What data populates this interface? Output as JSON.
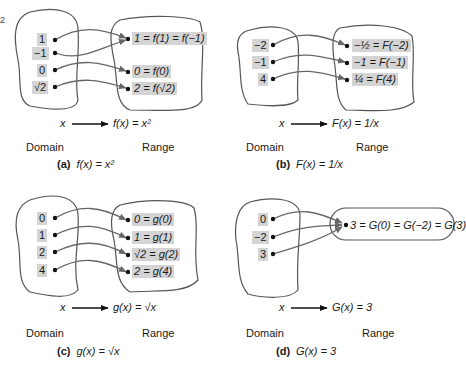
{
  "corner_mark": "2",
  "common": {
    "domain_label": "Domain",
    "range_label": "Range"
  },
  "panels": [
    {
      "id": "a",
      "caption_letter": "(a)",
      "caption_formula": "f(x) = x²",
      "mapping_x": "x",
      "mapping_fx": "f(x) = x²",
      "domain": [
        "1",
        "−1",
        "0",
        "√2"
      ],
      "range": [
        "1 = f(1) = f(−1)",
        "0 = f(0)",
        "2 = f(√2)"
      ],
      "arrows": [
        [
          0,
          0
        ],
        [
          1,
          0
        ],
        [
          2,
          1
        ],
        [
          3,
          2
        ]
      ]
    },
    {
      "id": "b",
      "caption_letter": "(b)",
      "caption_formula": "F(x) = 1/x",
      "mapping_x": "x",
      "mapping_fx": "F(x) = 1/x",
      "domain": [
        "−2",
        "−1",
        "4"
      ],
      "range": [
        "−½ = F(−2)",
        "−1 = F(−1)",
        "¼ = F(4)"
      ],
      "arrows": [
        [
          0,
          0
        ],
        [
          1,
          1
        ],
        [
          2,
          2
        ]
      ]
    },
    {
      "id": "c",
      "caption_letter": "(c)",
      "caption_formula": "g(x) = √x",
      "mapping_x": "x",
      "mapping_fx": "g(x) = √x",
      "domain": [
        "0",
        "1",
        "2",
        "4"
      ],
      "range": [
        "0 = g(0)",
        "1 = g(1)",
        "√2 = g(2)",
        "2 = g(4)"
      ],
      "arrows": [
        [
          0,
          0
        ],
        [
          1,
          1
        ],
        [
          2,
          2
        ],
        [
          3,
          3
        ]
      ]
    },
    {
      "id": "d",
      "caption_letter": "(d)",
      "caption_formula": "G(x) = 3",
      "mapping_x": "x",
      "mapping_fx": "G(x) = 3",
      "domain": [
        "0",
        "−2",
        "3"
      ],
      "range": [
        "3 = G(0) = G(−2) = G(3)"
      ],
      "arrows": [
        [
          0,
          0
        ],
        [
          1,
          0
        ],
        [
          2,
          0
        ]
      ]
    }
  ]
}
